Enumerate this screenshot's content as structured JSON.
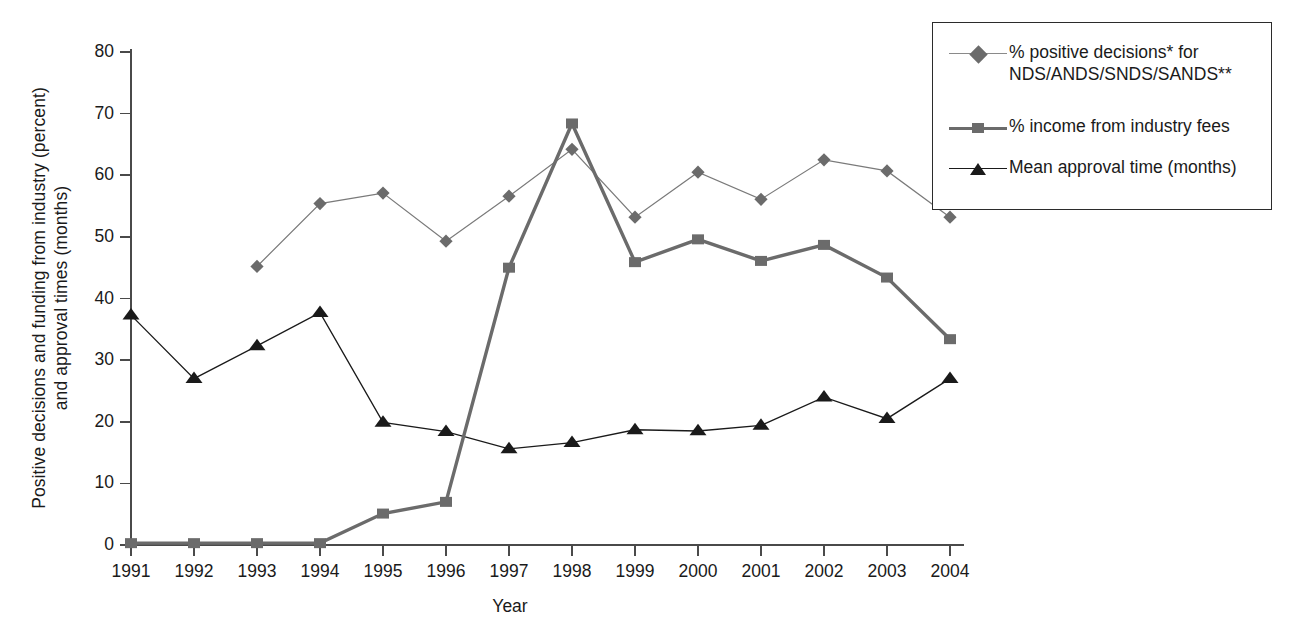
{
  "chart_data": {
    "type": "line",
    "title": "",
    "xlabel": "Year",
    "ylabel": "Positive decisions and funding from industry (percent)\nand approval times (months)",
    "categories": [
      "1991",
      "1992",
      "1993",
      "1994",
      "1995",
      "1996",
      "1997",
      "1998",
      "1999",
      "2000",
      "2001",
      "2002",
      "2003",
      "2004"
    ],
    "x": [
      1991,
      1992,
      1993,
      1994,
      1995,
      1996,
      1997,
      1998,
      1999,
      2000,
      2001,
      2002,
      2003,
      2004
    ],
    "ylim": [
      0,
      80
    ],
    "yticks": [
      0,
      10,
      20,
      30,
      40,
      50,
      60,
      70,
      80
    ],
    "grid": false,
    "legend_position": "upper right outside",
    "series": [
      {
        "name": "% positive decisions* for\nNDS/ANDS/SNDS/SANDS**",
        "marker": "diamond",
        "color": "#6b6b6b",
        "line_color": "#7a7a7a",
        "line_width": 1.2,
        "values": [
          null,
          null,
          45.2,
          55.4,
          57.1,
          49.3,
          56.6,
          64.2,
          53.2,
          60.5,
          56.1,
          62.5,
          60.7,
          53.2
        ]
      },
      {
        "name": "% income from industry fees",
        "marker": "square",
        "color": "#6b6b6b",
        "line_color": "#6b6b6b",
        "line_width": 3.4,
        "values": [
          0.3,
          0.3,
          0.3,
          0.3,
          5.1,
          7.0,
          45.0,
          68.4,
          45.9,
          49.6,
          46.1,
          48.7,
          43.4,
          33.4
        ]
      },
      {
        "name": "Mean approval time (months)",
        "marker": "triangle",
        "color": "#1a1a1a",
        "line_color": "#1a1a1a",
        "line_width": 1.3,
        "values": [
          37.3,
          27.0,
          32.3,
          37.7,
          19.9,
          18.4,
          15.6,
          16.6,
          18.7,
          18.5,
          19.4,
          24.0,
          20.5,
          27.0
        ]
      }
    ]
  },
  "axis": {
    "x_tick_labels": [
      "1991",
      "1992",
      "1993",
      "1994",
      "1995",
      "1996",
      "1997",
      "1998",
      "1999",
      "2000",
      "2001",
      "2002",
      "2003",
      "2004"
    ],
    "y_tick_labels": [
      "80",
      "70",
      "60",
      "50",
      "40",
      "30",
      "20",
      "10",
      "0"
    ],
    "x_title": "Year",
    "y_title": "Positive decisions and funding from industry (percent)\nand approval times (months)",
    "axis_color": "#4a4a4a"
  },
  "legend": {
    "items": [
      {
        "label": "% positive decisions* for\nNDS/ANDS/SNDS/SANDS**",
        "marker": "diamond",
        "color": "#6b6b6b",
        "line_color": "#8a8a8a",
        "line_width": 1.2
      },
      {
        "label": "% income from industry fees",
        "marker": "square",
        "color": "#6b6b6b",
        "line_color": "#6b6b6b",
        "line_width": 3.4
      },
      {
        "label": "Mean approval time (months)",
        "marker": "triangle",
        "color": "#1a1a1a",
        "line_color": "#1a1a1a",
        "line_width": 1.4
      }
    ],
    "border_color": "#2b2b2b"
  }
}
